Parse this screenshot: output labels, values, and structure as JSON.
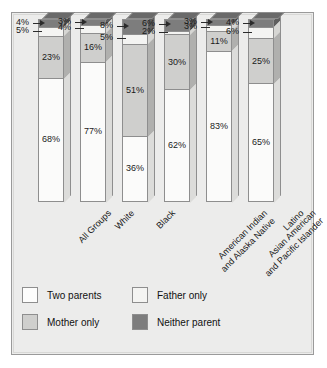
{
  "chart_data": {
    "type": "bar",
    "subtype": "100% stacked column (3D)",
    "title": "",
    "subtitle": "",
    "xlabel": "",
    "ylabel": "",
    "ylim": [
      0,
      100
    ],
    "grid": false,
    "legend_position": "bottom-left",
    "value_suffix": "%",
    "categories": [
      "All Groups",
      "White",
      "Black",
      "American Indian and Alaska Native",
      "Asian American and Pacific Islander",
      "Latino"
    ],
    "category_lines": [
      [
        "All Groups"
      ],
      [
        "White"
      ],
      [
        "Black"
      ],
      [
        "American Indian",
        "and Alaska Native"
      ],
      [
        "Asian American",
        "and Pacific Islander"
      ],
      [
        "Latino"
      ]
    ],
    "series": [
      {
        "name": "Two parents",
        "color": "#fbfbfa",
        "values": [
          68,
          77,
          36,
          62,
          83,
          65
        ]
      },
      {
        "name": "Mother only",
        "color": "#cfcfcd",
        "values": [
          23,
          16,
          51,
          30,
          11,
          25
        ]
      },
      {
        "name": "Father only",
        "color": "#f4f4f2",
        "values": [
          5,
          4,
          5,
          2,
          3,
          6
        ]
      },
      {
        "name": "Neither parent",
        "color": "#7d7d7d",
        "values": [
          4,
          3,
          8,
          6,
          3,
          4
        ]
      }
    ]
  },
  "bars": [
    {
      "category": "All Groups",
      "labels": {
        "two": "68%",
        "mother": "23%",
        "father": "5%",
        "neither": "4%"
      }
    },
    {
      "category": "White",
      "labels": {
        "two": "77%",
        "mother": "16%",
        "father": "4%",
        "neither": "3%"
      }
    },
    {
      "category": "Black",
      "labels": {
        "two": "36%",
        "mother": "51%",
        "father": "5%",
        "neither": "8%"
      }
    },
    {
      "category": "American Indian and Alaska Native",
      "labels": {
        "two": "62%",
        "mother": "30%",
        "father": "2%",
        "neither": "6%"
      }
    },
    {
      "category": "Asian American and Pacific Islander",
      "labels": {
        "two": "83%",
        "mother": "11%",
        "father": "3%",
        "neither": "3%"
      }
    },
    {
      "category": "Latino",
      "labels": {
        "two": "65%",
        "mother": "25%",
        "father": "6%",
        "neither": "4%"
      }
    }
  ],
  "legend": {
    "items": [
      {
        "label": "Two parents",
        "swatch": "two"
      },
      {
        "label": "Father only",
        "swatch": "father"
      },
      {
        "label": "Mother only",
        "swatch": "mother"
      },
      {
        "label": "Neither parent",
        "swatch": "neither"
      }
    ]
  },
  "colors": {
    "panel_background": "#ececeb",
    "panel_border": "#9a9a9a",
    "page_background": "#ffffff",
    "two_parents": "#fbfbfa",
    "mother_only": "#cfcfcd",
    "father_only": "#f4f4f2",
    "neither_parent": "#7d7d7d",
    "bar_outline": "#8e8e8e",
    "text": "#171717"
  }
}
